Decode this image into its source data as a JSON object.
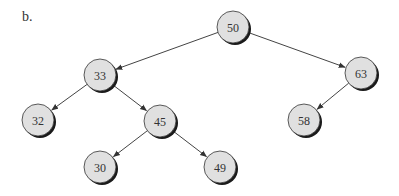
{
  "figure_label": "b.",
  "tree": {
    "type": "binary-search-tree",
    "root": "50",
    "nodes": [
      {
        "id": "50",
        "value": "50",
        "x": 233,
        "y": 27
      },
      {
        "id": "33",
        "value": "33",
        "x": 100,
        "y": 75
      },
      {
        "id": "63",
        "value": "63",
        "x": 361,
        "y": 73
      },
      {
        "id": "32",
        "value": "32",
        "x": 38,
        "y": 120
      },
      {
        "id": "45",
        "value": "45",
        "x": 160,
        "y": 121
      },
      {
        "id": "58",
        "value": "58",
        "x": 304,
        "y": 120
      },
      {
        "id": "30",
        "value": "30",
        "x": 100,
        "y": 167
      },
      {
        "id": "49",
        "value": "49",
        "x": 220,
        "y": 167
      }
    ],
    "edges": [
      {
        "from": "50",
        "to": "33",
        "side": "left"
      },
      {
        "from": "50",
        "to": "63",
        "side": "right"
      },
      {
        "from": "33",
        "to": "32",
        "side": "left"
      },
      {
        "from": "33",
        "to": "45",
        "side": "right"
      },
      {
        "from": "63",
        "to": "58",
        "side": "left"
      },
      {
        "from": "45",
        "to": "30",
        "side": "left"
      },
      {
        "from": "45",
        "to": "49",
        "side": "right"
      }
    ]
  },
  "style": {
    "node_fill": "#e0e0e0",
    "node_stroke": "#333333",
    "shadow": "#1a1a1a",
    "edge_color": "#444444",
    "node_radius": 16
  }
}
